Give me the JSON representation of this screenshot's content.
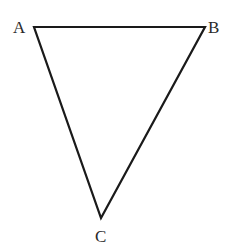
{
  "diagram": {
    "type": "triangle",
    "stroke_color": "#1a1a1a",
    "fill_color": "none",
    "vertices": [
      {
        "label": "A",
        "x": 34,
        "y": 27
      },
      {
        "label": "B",
        "x": 205,
        "y": 27
      },
      {
        "label": "C",
        "x": 101,
        "y": 218
      }
    ]
  },
  "labels": {
    "a": "A",
    "b": "B",
    "c": "C"
  }
}
